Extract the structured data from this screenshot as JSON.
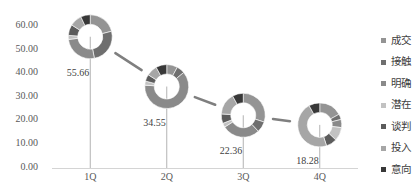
{
  "chart_data": {
    "type": "line",
    "title": "",
    "xlabel": "",
    "ylabel": "",
    "categories": [
      "1Q",
      "2Q",
      "3Q",
      "4Q"
    ],
    "series": [
      {
        "name": "",
        "values": [
          55.66,
          34.55,
          22.36,
          18.28
        ]
      }
    ],
    "ylim": [
      0,
      60
    ],
    "yticks": [
      "0.00",
      "10.00",
      "20.00",
      "30.00",
      "40.00",
      "50.00",
      "60.00"
    ],
    "grid": false,
    "drop_lines": true,
    "data_labels": true,
    "legend_position": "right",
    "legend": [
      {
        "label": "成交",
        "color": "#949494"
      },
      {
        "label": "接触",
        "color": "#6f6f6f"
      },
      {
        "label": "明确",
        "color": "#8a8a8a"
      },
      {
        "label": "潜在",
        "color": "#c2c2c2"
      },
      {
        "label": "谈判",
        "color": "#5c5c5c"
      },
      {
        "label": "投入",
        "color": "#a6a6a6"
      },
      {
        "label": "意向",
        "color": "#383838"
      }
    ],
    "marker_type": "doughnut",
    "marker_breakdown_percent": [
      [
        21,
        26,
        26,
        3,
        8,
        9,
        7
      ],
      [
        8,
        6,
        62,
        3,
        5,
        8,
        8
      ],
      [
        30,
        8,
        28,
        3,
        7,
        16,
        8
      ],
      [
        17,
        4,
        6,
        10,
        8,
        47,
        8
      ]
    ],
    "colors": {
      "line": "#7f7f7f",
      "drop_line": "#b3b3b3",
      "axis": "#d4d4d4"
    }
  }
}
